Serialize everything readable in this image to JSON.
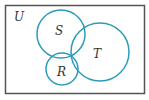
{
  "diagram": {
    "type": "venn",
    "universe_label": "U",
    "sets": [
      {
        "name": "S",
        "label": "S"
      },
      {
        "name": "T",
        "label": "T"
      },
      {
        "name": "R",
        "label": "R"
      }
    ],
    "shaded_region": "S ∩ R ∩ T",
    "colors": {
      "border": "#555555",
      "circle_stroke": "#2b9cb8",
      "shade_fill": "#bfe8f2"
    }
  }
}
